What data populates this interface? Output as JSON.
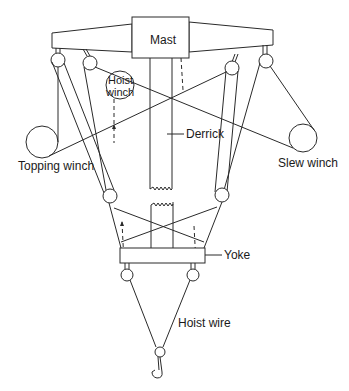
{
  "diagram": {
    "type": "derrick crane rigging schematic",
    "labels": {
      "mast": "Mast",
      "hoist_winch_line1": "Hoist",
      "hoist_winch_line2": "winch",
      "derrick": "Derrick",
      "topping_winch": "Topping winch",
      "slew_winch": "Slew winch",
      "yoke": "Yoke",
      "hoist_wire": "Hoist wire"
    },
    "colors": {
      "line": "#2a2a2a",
      "background": "#ffffff",
      "text": "#1a1a1a"
    }
  }
}
